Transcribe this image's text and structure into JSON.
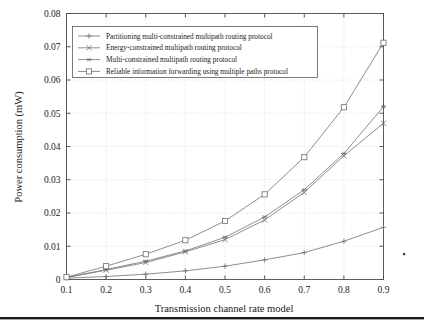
{
  "chart_data": {
    "type": "line",
    "title": "",
    "xlabel": "Transmission channel rate model",
    "ylabel": "Power consumption (mW)",
    "x": [
      0.1,
      0.2,
      0.3,
      0.4,
      0.5,
      0.6,
      0.7,
      0.8,
      0.9
    ],
    "xlim": [
      0.1,
      0.9
    ],
    "ylim": [
      0,
      0.08
    ],
    "xticks": [
      "0.1",
      "0.2",
      "0.3",
      "0.4",
      "0.5",
      "0.6",
      "0.7",
      "0.8",
      "0.9"
    ],
    "yticks": [
      "0",
      "0.01",
      "0.02",
      "0.03",
      "0.04",
      "0.05",
      "0.06",
      "0.07",
      "0.08"
    ],
    "grid": true,
    "legend_position": "upper left",
    "series": [
      {
        "name": "Partitioning multi-constrained multipath routing protocol",
        "marker": "plus",
        "values": [
          0.0004,
          0.0009,
          0.0016,
          0.0026,
          0.004,
          0.0059,
          0.0081,
          0.0115,
          0.0157
        ]
      },
      {
        "name": "Energy-constrained multipath routing protocol",
        "marker": "cross",
        "values": [
          0.0006,
          0.0028,
          0.0051,
          0.0083,
          0.012,
          0.0179,
          0.0262,
          0.0372,
          0.047
        ]
      },
      {
        "name": "Multi-constrained multipath routing protocol",
        "marker": "asterisk",
        "values": [
          0.0006,
          0.003,
          0.0055,
          0.0086,
          0.0127,
          0.0188,
          0.027,
          0.0379,
          0.052
        ]
      },
      {
        "name": "Reliable information forwarding using multiple paths protocol",
        "marker": "square",
        "values": [
          0.0007,
          0.004,
          0.0076,
          0.0118,
          0.0176,
          0.0256,
          0.0368,
          0.0518,
          0.0712
        ]
      }
    ]
  },
  "figure": {
    "axis_color": "#4a4a4a",
    "line_color": "#7a7a7a",
    "grid_color": "#bdbdbd",
    "rule_color": "#1c1c1c"
  }
}
